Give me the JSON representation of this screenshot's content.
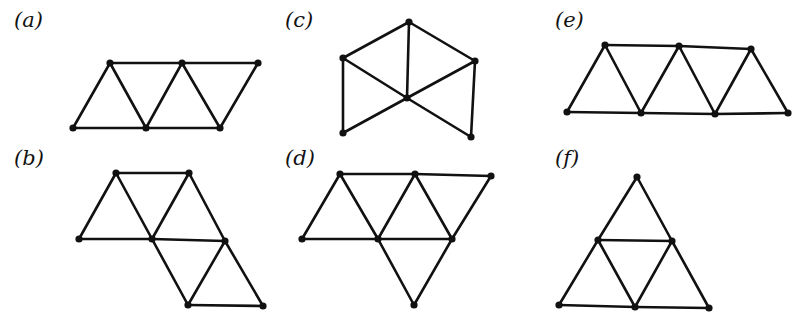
{
  "figure": {
    "type": "triangular-lattice graphs",
    "panels": [
      {
        "id": "a",
        "label": "(a)",
        "vertices": [
          "t1",
          "t2",
          "t3",
          "b1",
          "b2",
          "b3"
        ],
        "edges": [
          [
            "t1",
            "t2"
          ],
          [
            "t2",
            "t3"
          ],
          [
            "b1",
            "b2"
          ],
          [
            "b2",
            "b3"
          ],
          [
            "b1",
            "t1"
          ],
          [
            "t1",
            "b2"
          ],
          [
            "b2",
            "t2"
          ],
          [
            "t2",
            "b3"
          ],
          [
            "b3",
            "t3"
          ]
        ]
      },
      {
        "id": "b",
        "label": "(b)",
        "vertices": [
          "t1",
          "t2",
          "m1",
          "m2",
          "m3",
          "b1",
          "b2"
        ],
        "edges": [
          [
            "t1",
            "t2"
          ],
          [
            "m1",
            "m2"
          ],
          [
            "m2",
            "m3"
          ],
          [
            "b1",
            "b2"
          ],
          [
            "m1",
            "t1"
          ],
          [
            "t1",
            "m2"
          ],
          [
            "m2",
            "t2"
          ],
          [
            "t2",
            "m3"
          ],
          [
            "m2",
            "b1"
          ],
          [
            "b1",
            "m3"
          ],
          [
            "m3",
            "b2"
          ]
        ]
      },
      {
        "id": "c",
        "label": "(c)",
        "vertices": [
          "top",
          "left",
          "right",
          "center",
          "bottom-left",
          "bottom-right"
        ],
        "edges": [
          [
            "left",
            "top"
          ],
          [
            "top",
            "right"
          ],
          [
            "top",
            "center"
          ],
          [
            "left",
            "center"
          ],
          [
            "right",
            "center"
          ],
          [
            "left",
            "bottom-left"
          ],
          [
            "right",
            "bottom-right"
          ],
          [
            "bottom-left",
            "center"
          ],
          [
            "center",
            "bottom-right"
          ]
        ]
      },
      {
        "id": "d",
        "label": "(d)",
        "vertices": [
          "t1",
          "t2",
          "t3",
          "m1",
          "m2",
          "m3",
          "b1"
        ],
        "edges": [
          [
            "t1",
            "t2"
          ],
          [
            "t2",
            "t3"
          ],
          [
            "m1",
            "m2"
          ],
          [
            "m2",
            "m3"
          ],
          [
            "m1",
            "t1"
          ],
          [
            "t1",
            "m2"
          ],
          [
            "m2",
            "t2"
          ],
          [
            "t2",
            "m3"
          ],
          [
            "m3",
            "t3"
          ],
          [
            "m2",
            "b1"
          ],
          [
            "b1",
            "m3"
          ]
        ]
      },
      {
        "id": "e",
        "label": "(e)",
        "vertices": [
          "t1",
          "t2",
          "t3",
          "b1",
          "b2",
          "b3",
          "b4"
        ],
        "edges": [
          [
            "t1",
            "t2"
          ],
          [
            "t2",
            "t3"
          ],
          [
            "b1",
            "b2"
          ],
          [
            "b2",
            "b3"
          ],
          [
            "b3",
            "b4"
          ],
          [
            "b1",
            "t1"
          ],
          [
            "t1",
            "b2"
          ],
          [
            "b2",
            "t2"
          ],
          [
            "t2",
            "b3"
          ],
          [
            "b3",
            "t3"
          ],
          [
            "t3",
            "b4"
          ]
        ]
      },
      {
        "id": "f",
        "label": "(f)",
        "vertices": [
          "apex",
          "m1",
          "m2",
          "b1",
          "b2",
          "b3"
        ],
        "edges": [
          [
            "apex",
            "m1"
          ],
          [
            "apex",
            "m2"
          ],
          [
            "m1",
            "m2"
          ],
          [
            "m1",
            "b1"
          ],
          [
            "m1",
            "b2"
          ],
          [
            "m2",
            "b2"
          ],
          [
            "m2",
            "b3"
          ],
          [
            "b1",
            "b2"
          ],
          [
            "b2",
            "b3"
          ]
        ]
      }
    ]
  }
}
